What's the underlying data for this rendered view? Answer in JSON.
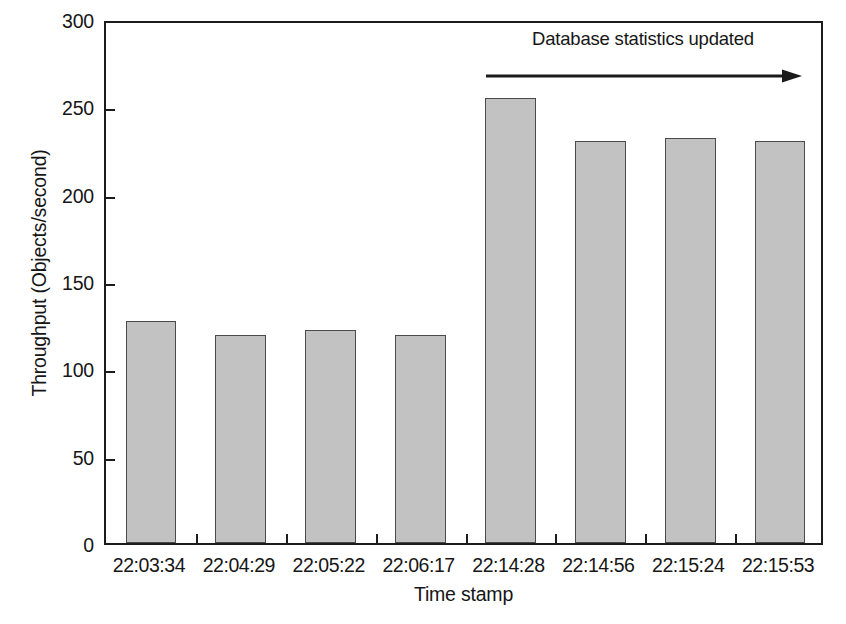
{
  "chart_data": {
    "type": "bar",
    "title": "",
    "xlabel": "Time stamp",
    "ylabel": "Throughput (Objects/second)",
    "categories": [
      "22:03:34",
      "22:04:29",
      "22:05:22",
      "22:06:17",
      "22:14:28",
      "22:14:56",
      "22:15:24",
      "22:15:53"
    ],
    "values": [
      127,
      119,
      122,
      119,
      255,
      230,
      232,
      230
    ],
    "ylim": [
      0,
      300
    ],
    "yticks": [
      0,
      50,
      100,
      150,
      200,
      250,
      300
    ],
    "ytick_labels": [
      "0",
      "50",
      "100",
      "150",
      "200",
      "250",
      "300"
    ],
    "grid": false,
    "legend": null,
    "annotations": [
      {
        "text": "Database statistics updated",
        "arrow": "right-arrow",
        "spans_categories": [
          "22:14:28",
          "22:15:53"
        ]
      }
    ],
    "bar_fill_color": "#c2c2c2",
    "bar_edge_color": "#4a4a4a",
    "axis_color": "#1c1c1c"
  }
}
